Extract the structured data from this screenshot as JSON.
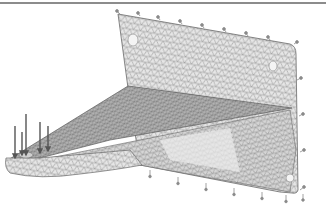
{
  "figure": {
    "colors": {
      "background": "#ffffff",
      "frame_line": "#8c8c8c",
      "mesh_fill_light": "#e4e4e4",
      "mesh_fill_mid": "#c9c9c9",
      "mesh_fill_dark": "#a9a9a9",
      "mesh_line": "#6e6e6e",
      "constraint_symbol": "#8a8a8a",
      "load_arrow": "#555555"
    },
    "parts": [
      {
        "name": "back-plate",
        "shading": "light"
      },
      {
        "name": "top-flange",
        "shading": "dark"
      },
      {
        "name": "gusset-web",
        "shading": "light"
      },
      {
        "name": "tip-lug",
        "shading": "light"
      }
    ],
    "holes": [
      {
        "part": "back-plate",
        "x": 133,
        "y": 40
      },
      {
        "part": "back-plate",
        "x": 273,
        "y": 66
      },
      {
        "part": "back-plate",
        "x": 290,
        "y": 178
      },
      {
        "part": "tip-lug",
        "x": 26,
        "y": 155
      }
    ],
    "constraints": {
      "top_edge": [
        [
          120,
          14
        ],
        [
          140,
          16
        ],
        [
          160,
          20
        ],
        [
          180,
          24
        ],
        [
          200,
          28
        ],
        [
          220,
          32
        ],
        [
          240,
          36
        ],
        [
          262,
          40
        ],
        [
          284,
          44
        ]
      ],
      "right_edge": [
        [
          297,
          72
        ],
        [
          299,
          108
        ],
        [
          300,
          145
        ],
        [
          301,
          180
        ],
        [
          303,
          194
        ]
      ],
      "bottom_edge": [
        [
          148,
          176
        ],
        [
          176,
          183
        ],
        [
          204,
          189
        ],
        [
          232,
          195
        ],
        [
          260,
          200
        ],
        [
          285,
          203
        ]
      ]
    },
    "loads": [
      {
        "x": 15,
        "y1": 125,
        "y2": 155
      },
      {
        "x": 22,
        "y1": 130,
        "y2": 152
      },
      {
        "x": 26,
        "y1": 115,
        "y2": 152
      },
      {
        "x": 40,
        "y1": 122,
        "y2": 150
      },
      {
        "x": 48,
        "y1": 126,
        "y2": 148
      }
    ]
  }
}
